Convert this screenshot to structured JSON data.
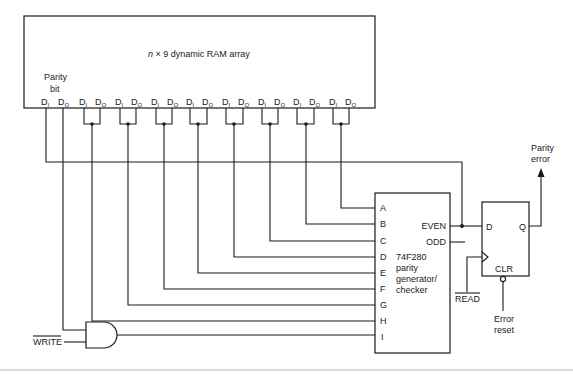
{
  "diagram": {
    "type": "logic-circuit",
    "ram_array": {
      "title_var": "n",
      "title_rest": " × 9 dynamic RAM array",
      "parity_label_line1": "Parity",
      "parity_label_line2": "bit",
      "pin_in": "D",
      "pin_in_sub": "I",
      "pin_out": "D",
      "pin_out_sub": "O",
      "bit_count": 9
    },
    "parity_chip": {
      "part": "74F280",
      "desc_line1": "parity",
      "desc_line2": "generator/",
      "desc_line3": "checker",
      "inputs": [
        "A",
        "B",
        "C",
        "D",
        "E",
        "F",
        "G",
        "H",
        "I"
      ],
      "out_even": "EVEN",
      "out_odd": "ODD"
    },
    "flip_flop": {
      "d": "D",
      "q": "Q",
      "clr": "CLR"
    },
    "signals": {
      "read": "READ",
      "write": "WRITE",
      "error_reset_line1": "Error",
      "error_reset_line2": "reset",
      "parity_error_line1": "Parity",
      "parity_error_line2": "error"
    },
    "gate": "AND"
  }
}
